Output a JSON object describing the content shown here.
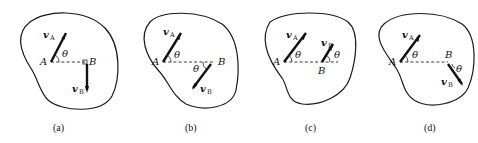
{
  "figure": {
    "panels": [
      {
        "id": "a",
        "caption": "(a)",
        "point_a": "A",
        "point_b": "B",
        "vel_a_symbol": "v",
        "vel_a_sub": "A",
        "vel_b_symbol": "v",
        "vel_b_sub": "B",
        "angle": "θ",
        "description": "vA inclined at θ above AB; vB perpendicular to AB pointing down (right-angle mark at B)"
      },
      {
        "id": "b",
        "caption": "(b)",
        "point_a": "A",
        "point_b": "B",
        "vel_a_symbol": "v",
        "vel_a_sub": "A",
        "vel_b_symbol": "v",
        "vel_b_sub": "B",
        "angle_a": "θ",
        "angle_b": "θ",
        "description": "vA at θ above AB; vB parallel to vA but pointing opposite direction (down-left), angle θ below AB"
      },
      {
        "id": "c",
        "caption": "(c)",
        "point_a": "A",
        "point_b": "B",
        "vel_a_symbol": "v",
        "vel_a_sub": "A",
        "vel_b_symbol": "v",
        "vel_b_sub": "B",
        "angle_a": "θ",
        "angle_b": "θ",
        "description": "vA and vB parallel, both at θ above AB, vB shorter"
      },
      {
        "id": "d",
        "caption": "(d)",
        "point_a": "A",
        "point_b": "B",
        "vel_a_symbol": "v",
        "vel_a_sub": "A",
        "vel_b_symbol": "v",
        "vel_b_sub": "B",
        "angle_a": "θ",
        "angle_b": "θ",
        "description": "vA at θ above AB; vB pointing down-right at θ below AB extension"
      }
    ]
  }
}
